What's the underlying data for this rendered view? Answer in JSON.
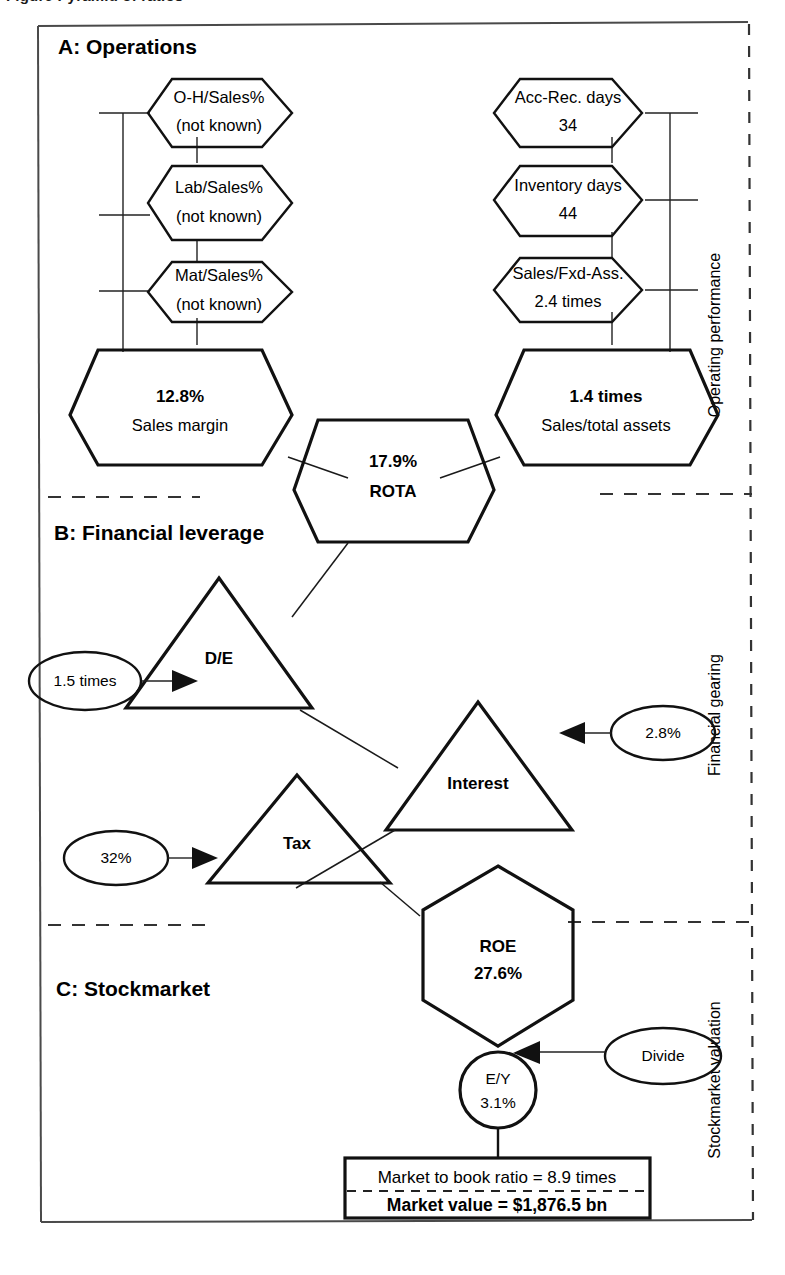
{
  "figure": {
    "caption_partial": "Figure    Pyramid of ratios"
  },
  "sections": [
    {
      "id": "A",
      "heading": "A: Operations",
      "side_label": "Operating performance"
    },
    {
      "id": "B",
      "heading": "B: Financial leverage",
      "side_label": "Financial gearing"
    },
    {
      "id": "C",
      "heading": "C: Stockmarket",
      "side_label": "Stockmarket valuation"
    }
  ],
  "section_a": {
    "left_column": [
      {
        "name": "oh-sales",
        "line1": "O-H/Sales%",
        "line2": "(not known)"
      },
      {
        "name": "lab-sales",
        "line1": "Lab/Sales%",
        "line2": "(not known)"
      },
      {
        "name": "mat-sales",
        "line1": "Mat/Sales%",
        "line2": "(not known)"
      }
    ],
    "right_column": [
      {
        "name": "acc-rec-days",
        "line1": "Acc-Rec. days",
        "line2": "34"
      },
      {
        "name": "inventory-days",
        "line1": "Inventory days",
        "line2": "44"
      },
      {
        "name": "sales-fxd-ass",
        "line1": "Sales/Fxd-Ass.",
        "line2": "2.4 times"
      }
    ],
    "sales_margin": {
      "value": "12.8%",
      "label": "Sales margin"
    },
    "sales_total_assets": {
      "value": "1.4 times",
      "label": "Sales/total assets"
    },
    "rota": {
      "value": "17.9%",
      "label": "ROTA"
    }
  },
  "section_b": {
    "de_triangle": {
      "label": "D/E",
      "input": "1.5 times"
    },
    "interest_triangle": {
      "label": "Interest",
      "input": "2.8%"
    },
    "tax_triangle": {
      "label": "Tax",
      "input": "32%"
    }
  },
  "section_c": {
    "roe": {
      "label": "ROE",
      "value": "27.6%"
    },
    "ey": {
      "label": "E/Y",
      "value": "3.1%"
    },
    "divide": "Divide",
    "market_to_book": "Market to book ratio = 8.9 times",
    "market_value": "Market value = $1,876.5 bn"
  },
  "colors": {
    "roe_fill": "#a8a8a8",
    "stroke": "#111111",
    "background": "#ffffff"
  }
}
